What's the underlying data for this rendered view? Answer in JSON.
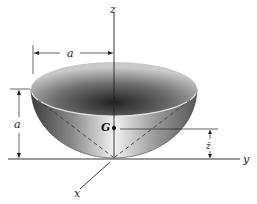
{
  "figure": {
    "labels": {
      "z_axis": "z",
      "y_axis": "y",
      "x_axis": "x",
      "radius_dim": "a",
      "height_dim": "a",
      "centroid": "G",
      "zbar": "z̄"
    },
    "colors": {
      "background": "#ffffff",
      "line": "#222222",
      "shell_dark": "#4a4a4a",
      "shell_light": "#f0f0f0",
      "rim_light": "#d8d8d8"
    }
  }
}
